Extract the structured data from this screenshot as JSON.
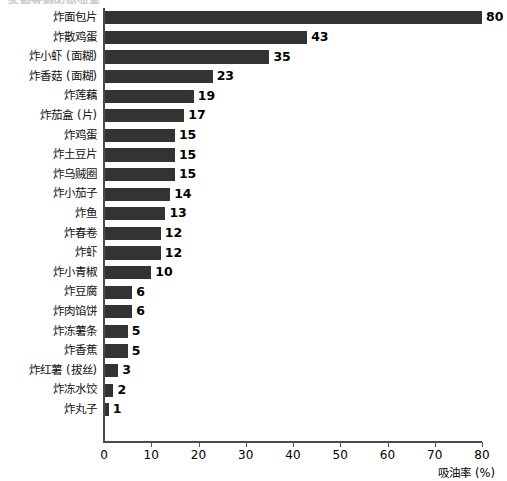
{
  "chart_data": {
    "type": "bar",
    "orientation": "horizontal",
    "title": "各种食物的吸油率",
    "xlabel": "吸油率 (%)",
    "ylabel": "",
    "xlim": [
      0,
      80
    ],
    "xticks": [
      0,
      10,
      20,
      30,
      40,
      50,
      60,
      70,
      80
    ],
    "grid": false,
    "legend": null,
    "bar_color": "#333333",
    "categories": [
      "炸面包片",
      "炸散鸡蛋",
      "炸小虾 (面糊)",
      "炸香菇 (面糊)",
      "炸莲藕",
      "炸茄盒 (片)",
      "炸鸡蛋",
      "炸土豆片",
      "炸乌贼圈",
      "炸小茄子",
      "炸鱼",
      "炸春卷",
      "炸虾",
      "炸小青椒",
      "炸豆腐",
      "炸肉馅饼",
      "炸冻薯条",
      "炸香蕉",
      "炸红薯 (拔丝)",
      "炸冻水饺",
      "炸丸子"
    ],
    "values": [
      80,
      43,
      35,
      23,
      19,
      17,
      15,
      15,
      15,
      14,
      13,
      12,
      12,
      10,
      6,
      6,
      5,
      5,
      3,
      2,
      1
    ],
    "value_labels": [
      "80",
      "43",
      "35",
      "23",
      "19",
      "17",
      "15",
      "15",
      "15",
      "14",
      "13",
      "12",
      "12",
      "10",
      "6",
      "6",
      "5",
      "5",
      "3",
      "2",
      "1"
    ]
  }
}
